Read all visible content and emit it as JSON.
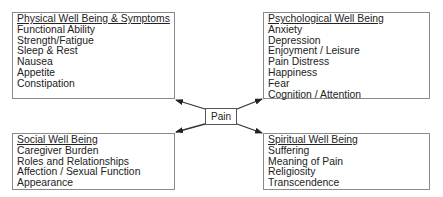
{
  "center": {
    "label": "Pain"
  },
  "boxes": {
    "physical": {
      "title": "Physical Well Being & Symptoms",
      "items": [
        "Functional Ability",
        "Strength/Fatigue",
        "Sleep & Rest",
        "Nausea",
        "Appetite",
        "Constipation"
      ]
    },
    "psychological": {
      "title": "Psychological Well Being",
      "items": [
        "Anxiety",
        "Depression",
        "Enjoyment / Leisure",
        "Pain Distress",
        "Happiness",
        "Fear",
        "Cognition / Attention"
      ]
    },
    "social": {
      "title": "Social Well Being",
      "items": [
        "Caregiver Burden",
        "Roles and Relationships",
        "Affection / Sexual Function",
        "Appearance"
      ]
    },
    "spiritual": {
      "title": "Spiritual Well Being",
      "items": [
        "Suffering",
        "Meaning of Pain",
        "Religiosity",
        "Transcendence"
      ]
    }
  },
  "colors": {
    "line": "#333333",
    "border": "#8a8a8a"
  }
}
